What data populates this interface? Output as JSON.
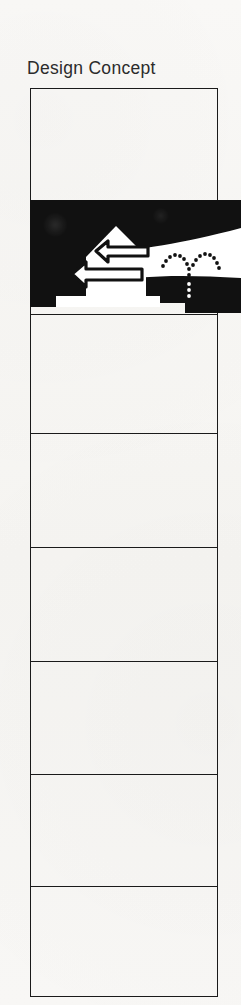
{
  "document": {
    "title": "Design Concept",
    "background_color": "#f7f6f4",
    "ink_color": "#1a1a1a",
    "width": 241,
    "height": 1005
  },
  "figure": {
    "name": "black-graphic-band",
    "fill_color": "#111111",
    "shape_color": "#ffffff",
    "top": 200,
    "height": 113,
    "bleeds_past_table": true,
    "elements": [
      "house-pentagon-shape",
      "left-arrow-upper",
      "left-arrow-lower",
      "white-swoosh-ribbon",
      "dotted-arc-motif"
    ]
  },
  "table": {
    "left": 30,
    "top": 88,
    "width": 188,
    "height": 909,
    "border_color": "#1a1a1a",
    "rows": [
      {
        "id": "row-1",
        "top": 0,
        "height": 112,
        "content": ""
      },
      {
        "id": "row-2",
        "top": 112,
        "height": 113,
        "content": ""
      },
      {
        "id": "row-3",
        "top": 225,
        "height": 119,
        "content": ""
      },
      {
        "id": "row-4",
        "top": 344,
        "height": 114,
        "content": ""
      },
      {
        "id": "row-5",
        "top": 458,
        "height": 114,
        "content": ""
      },
      {
        "id": "row-6",
        "top": 572,
        "height": 113,
        "content": ""
      },
      {
        "id": "row-7",
        "top": 685,
        "height": 112,
        "content": ""
      },
      {
        "id": "row-8",
        "top": 797,
        "height": 112,
        "content": ""
      }
    ],
    "dividers": [
      112,
      225,
      344,
      458,
      572,
      685,
      797
    ]
  }
}
